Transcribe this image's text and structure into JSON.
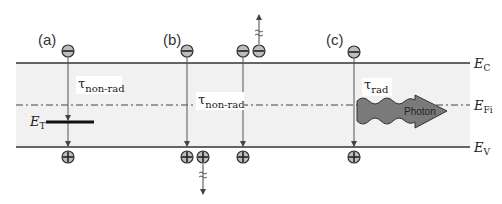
{
  "figure": {
    "panels": [
      {
        "label": "(a)",
        "process": "non-radiative recombination via trap level",
        "tau_symbol": "τ",
        "tau_subscript": "non-rad",
        "trap_label": "E",
        "trap_subscript": "T"
      },
      {
        "label": "(b)",
        "process": "Auger (non-radiative) recombination",
        "tau_symbol": "τ",
        "tau_subscript": "non-rad"
      },
      {
        "label": "(c)",
        "process": "radiative recombination",
        "tau_symbol": "τ",
        "tau_subscript": "rad",
        "photon_label": "Photon"
      }
    ],
    "levels": {
      "conduction": {
        "symbol": "E",
        "subscript": "C"
      },
      "intrinsic": {
        "symbol": "E",
        "subscript": "Fi"
      },
      "valence": {
        "symbol": "E",
        "subscript": "V"
      }
    },
    "carriers": {
      "electron_icon": "minus-circle",
      "hole_icon": "plus-circle"
    },
    "colors": {
      "band_fill": "#f1f1f1",
      "line": "#333333",
      "arrow": "#555555",
      "carrier_fill": "#b8b8b8",
      "photon_fill": "#7a7a7a"
    }
  }
}
